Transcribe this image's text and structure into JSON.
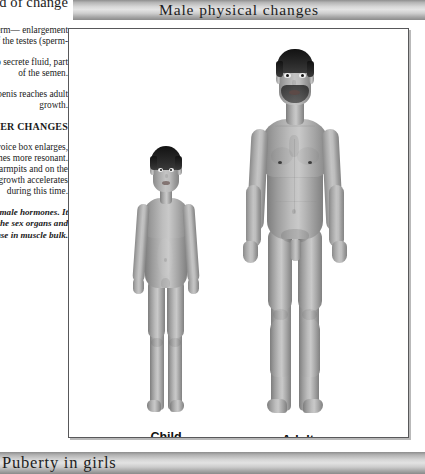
{
  "page": {
    "background_color": "#ffffff",
    "width": 425,
    "height": 474
  },
  "text_column": {
    "heading": "period of change",
    "paragraphs": [
      "Increased production of sperm— enlargement of the testes (sperm-",
      "The prostate gland begins to secrete fluid, part of the semen.",
      "Growth occurs so that the penis reaches adult growth."
    ],
    "subheading": "OTHER CHANGES",
    "paragraph_lower": "Around the age when the voice box enlarges, the voice deepens and becomes more resonant. Hair begins to grow in the armpits and on the lower abdomen. Body growth accelerates during this time.",
    "note": "Testosterone is one of the male hormones. It leads to the growth of the sex organs and causes an increase in muscle bulk."
  },
  "top_banner": {
    "title": "Male physical changes",
    "gradient_light": "#e4e4e4",
    "gradient_dark": "#8b8b8b",
    "text_color": "#1d1d1d"
  },
  "figure_panel": {
    "border_color": "#58585a",
    "background_color": "#ffffff",
    "figures": [
      {
        "id": "child",
        "label": "Child",
        "label_x": 165,
        "label_y": 416,
        "hair_color": "#1a1a1a",
        "skin_light": "#c9c9c9",
        "skin_dark": "#7d7d7d",
        "height_px": 272,
        "top_px": 145
      },
      {
        "id": "adult",
        "label": "Adult",
        "label_x": 298,
        "label_y": 416,
        "hair_color": "#141414",
        "skin_light": "#c4c4c4",
        "skin_dark": "#7a7a7a",
        "height_px": 375,
        "top_px": 40
      }
    ]
  },
  "bottom_banner": {
    "title": "Puberty in girls",
    "gradient_light": "#e2e2e2",
    "gradient_dark": "#8a8a8a",
    "text_color": "#1d1d1d"
  }
}
